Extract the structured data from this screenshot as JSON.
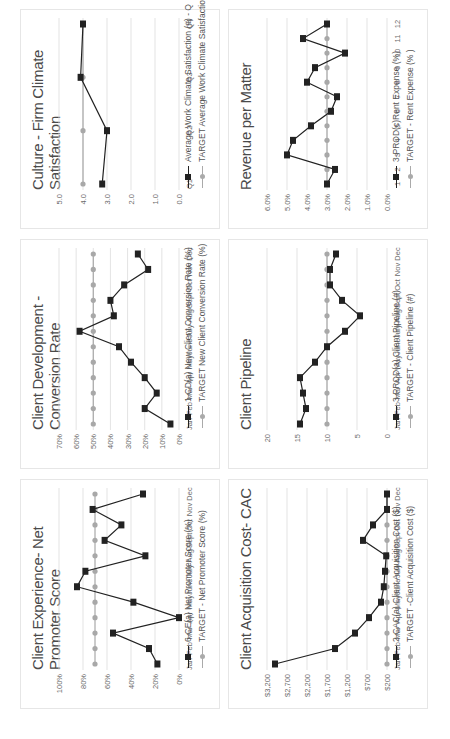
{
  "page": {
    "orientation": "rotated -90deg"
  },
  "colors": {
    "actual": "#222222",
    "target": "#a8a8a8",
    "grid": "#dcdcdc"
  },
  "panels": [
    {
      "id": "nps",
      "title": "Client Experience- Net Promoter Score",
      "legend": {
        "actual": "6-CE(a) Net Promoter Score (%)",
        "target": "TARGET - Net Promoter Score (%)"
      }
    },
    {
      "id": "conversion",
      "title": "Client Development - Conversion Rate",
      "legend": {
        "actual": "1-CD(a) New Client Conversion Rate (%)",
        "target": "TARGET New Client Conversion Rate (%)"
      }
    },
    {
      "id": "culture",
      "title": "Culture - Firm Climate Satisfaction",
      "legend": {
        "actual": "Average Work Climate Satisfaction (#) - Q",
        "target": "TARGET Average Work Climate Satisfaction (#)"
      }
    },
    {
      "id": "cac",
      "title": "Client Acquisition Cost- CAC",
      "legend": {
        "actual": "2-CAC(a) Client Acquisition Cost ($)",
        "target": "TARGET -Client Acquisition Cost ($)"
      }
    },
    {
      "id": "pipeline",
      "title": "Client Pipeline",
      "legend": {
        "actual": "3-PROD(a) Client Pipeline (#)",
        "target": "TARGET - Client Pipeline (#)"
      }
    },
    {
      "id": "revenue",
      "title": "Revenue per Matter",
      "legend": {
        "actual": "3-PROD(c)Rent Expense (%)",
        "target": "TARGET - Rent Expense (% )"
      }
    }
  ],
  "chart_data": [
    {
      "type": "line",
      "title": "Client Experience- Net Promoter Score",
      "categories": [
        "Jan",
        "Feb",
        "Mar",
        "Apr",
        "May",
        "June",
        "July",
        "Aug",
        "Sept",
        "Oct",
        "Nov",
        "Dec"
      ],
      "series": [
        {
          "name": "6-CE(a) Net Promoter Score (%)",
          "values": [
            18,
            25,
            55,
            0,
            38,
            85,
            78,
            28,
            62,
            48,
            72,
            30
          ]
        },
        {
          "name": "TARGET - Net Promoter Score (%)",
          "values": [
            70,
            70,
            70,
            70,
            70,
            70,
            70,
            70,
            70,
            70,
            70,
            70
          ]
        }
      ],
      "yticks": [
        "0%",
        "20%",
        "40%",
        "60%",
        "80%",
        "100%"
      ],
      "ylim": [
        0,
        100
      ],
      "grid": true,
      "legend_position": "bottom"
    },
    {
      "type": "line",
      "title": "Client Development - Conversion Rate",
      "categories": [
        "Jan",
        "Feb",
        "Mar",
        "Apr",
        "May",
        "June",
        "July",
        "Aug",
        "Sept",
        "Oct",
        "Nov",
        "Dec"
      ],
      "series": [
        {
          "name": "1-CD(a) New Client Conversion Rate (%)",
          "values": [
            5,
            20,
            13,
            20,
            28,
            35,
            58,
            38,
            40,
            32,
            18,
            24
          ]
        },
        {
          "name": "TARGET New Client Conversion Rate (%)",
          "values": [
            50,
            50,
            50,
            50,
            50,
            50,
            50,
            50,
            50,
            50,
            50,
            50
          ]
        }
      ],
      "yticks": [
        "0%",
        "10%",
        "20%",
        "30%",
        "40%",
        "50%",
        "60%",
        "70%"
      ],
      "ylim": [
        0,
        70
      ],
      "grid": true,
      "legend_position": "bottom"
    },
    {
      "type": "line",
      "title": "Culture - Firm Climate Satisfaction",
      "categories": [
        "Q1",
        "Q2",
        "Q3",
        "Q4"
      ],
      "series": [
        {
          "name": "Average Work Climate Satisfaction (#) - Q",
          "values": [
            3.2,
            3.0,
            4.1,
            4.0
          ]
        },
        {
          "name": "TARGET Average Work Climate Satisfaction (#)",
          "values": [
            4.0,
            4.0,
            4.0,
            4.0
          ]
        }
      ],
      "yticks": [
        "0.0",
        "1.0",
        "2.0",
        "3.0",
        "4.0",
        "5.0"
      ],
      "ylim": [
        0,
        5
      ],
      "grid": true,
      "legend_position": "bottom"
    },
    {
      "type": "line",
      "title": "Client Acquisition Cost- CAC",
      "categories": [
        "Jan",
        "Feb",
        "Mar",
        "Apr",
        "May",
        "June",
        "July",
        "Aug",
        "Sept",
        "Oct",
        "Nov",
        "Dec"
      ],
      "series": [
        {
          "name": "2-CAC(a) Client Acquisition Cost ($)",
          "values": [
            3000,
            1500,
            1000,
            650,
            350,
            280,
            250,
            220,
            800,
            550,
            200,
            200
          ]
        },
        {
          "name": "TARGET -Client Acquisition Cost ($)",
          "values": [
            200,
            200,
            200,
            200,
            200,
            200,
            200,
            200,
            200,
            200,
            200,
            200
          ]
        }
      ],
      "yticks": [
        "$200",
        "$700",
        "$1,200",
        "$1,700",
        "$2,200",
        "$2,700",
        "$3,200"
      ],
      "ylim": [
        200,
        3200
      ],
      "grid": true,
      "legend_position": "bottom"
    },
    {
      "type": "line",
      "title": "Client Pipeline",
      "categories": [
        "Jan",
        "Feb",
        "Mar",
        "Apr",
        "May",
        "June",
        "July",
        "Aug",
        "Sept",
        "Oct",
        "Nov",
        "Dec"
      ],
      "series": [
        {
          "name": "3-PROD(a) Client Pipeline (#)",
          "values": [
            14.5,
            13.5,
            14,
            14.5,
            12,
            10,
            7,
            4.5,
            7.5,
            9.5,
            9.5,
            8.5
          ]
        },
        {
          "name": "TARGET - Client Pipeline (#)",
          "values": [
            10,
            10,
            10,
            10,
            10,
            10,
            10,
            10,
            10,
            10,
            10,
            10
          ]
        }
      ],
      "yticks": [
        "0",
        "5",
        "10",
        "15",
        "20"
      ],
      "ylim": [
        0,
        20
      ],
      "grid": true,
      "legend_position": "bottom"
    },
    {
      "type": "line",
      "title": "Revenue per Matter",
      "categories": [
        "1",
        "2",
        "3",
        "4",
        "5",
        "6",
        "7",
        "8",
        "9",
        "10",
        "11",
        "12"
      ],
      "series": [
        {
          "name": "3-PROD(c)Rent Expense (%)",
          "values": [
            3.0,
            2.6,
            5.0,
            4.7,
            3.8,
            2.8,
            2.5,
            4.0,
            3.6,
            2.1,
            4.2,
            3.0
          ]
        },
        {
          "name": "TARGET - Rent Expense (% )",
          "values": [
            3.0,
            3.0,
            3.0,
            3.0,
            3.0,
            3.0,
            3.0,
            3.0,
            3.0,
            3.0,
            3.0,
            3.0
          ]
        }
      ],
      "yticks": [
        "0.0%",
        "1.0%",
        "2.0%",
        "3.0%",
        "4.0%",
        "5.0%",
        "6.0%"
      ],
      "ylim": [
        0,
        6
      ],
      "grid": true,
      "legend_position": "bottom"
    }
  ]
}
